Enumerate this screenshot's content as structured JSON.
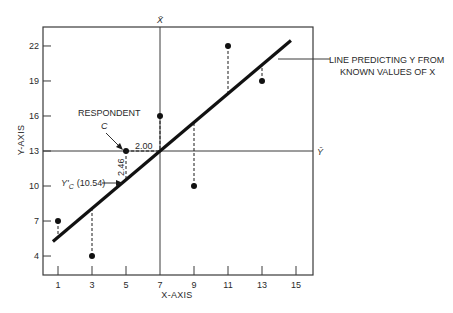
{
  "chart_data": {
    "type": "scatter",
    "title": "",
    "xlabel": "X-AXIS",
    "ylabel": "Y-AXIS",
    "xlim": [
      0,
      16
    ],
    "ylim": [
      1.5,
      23.7
    ],
    "x_ticks": [
      1,
      3,
      5,
      7,
      9,
      11,
      13,
      15
    ],
    "y_ticks": [
      4,
      7,
      10,
      13,
      16,
      19,
      22
    ],
    "grid": false,
    "legend": null,
    "series": [
      {
        "name": "Observed respondents",
        "points": [
          {
            "x": 1,
            "y": 7
          },
          {
            "x": 3,
            "y": 4
          },
          {
            "x": 5,
            "y": 13
          },
          {
            "x": 7,
            "y": 16
          },
          {
            "x": 9,
            "y": 10
          },
          {
            "x": 11,
            "y": 22
          },
          {
            "x": 13,
            "y": 19
          }
        ]
      }
    ],
    "regression_line": {
      "label": "LINE PREDICTING Y FROM KNOWN VALUES OF X",
      "slope": 1.23,
      "intercept": 4.39,
      "x_start": 0.7,
      "x_end": 14.7
    },
    "mean_lines": {
      "x_mean": 7,
      "x_mean_label": "X̄",
      "y_mean": 13,
      "y_mean_label": "Ȳ"
    },
    "residuals": "dashed vertical lines from each point to regression line",
    "annotations": [
      {
        "text": "RESPONDENT",
        "target": {
          "x": 5,
          "y": 13
        }
      },
      {
        "text": "C",
        "target": {
          "x": 5,
          "y": 13
        }
      },
      {
        "text": "2.00",
        "meaning": "horizontal distance from respondent C to X mean"
      },
      {
        "text": "2.46",
        "meaning": "vertical distance from Y mean to predicted Y'c"
      },
      {
        "text": "Y'c (10.54)",
        "meaning": "predicted value for respondent C",
        "value": 10.54
      }
    ]
  },
  "labels": {
    "x_axis": "X-AXIS",
    "y_axis": "Y-AXIS",
    "x_mean": "X̄",
    "y_mean": "Ȳ",
    "line_label_1": "LINE PREDICTING Y FROM",
    "line_label_2": "KNOWN VALUES OF X",
    "respondent": "RESPONDENT",
    "respondent_id": "C",
    "dist_x": "2.00",
    "dist_y": "2.46",
    "pred_prefix": "Y'",
    "pred_sub": "C",
    "pred_value": "(10.54)"
  },
  "colors": {
    "ink": "#1a1a1a",
    "frame": "#3a3a3a",
    "background": "#ffffff"
  }
}
